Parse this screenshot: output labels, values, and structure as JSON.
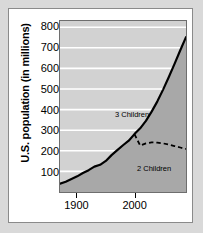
{
  "chart_data": {
    "type": "line",
    "title": "",
    "xlabel": "",
    "ylabel": "U.S. population (in millions)",
    "xlim": [
      1870,
      2090
    ],
    "ylim": [
      0,
      830
    ],
    "yticks": [
      100,
      200,
      300,
      400,
      500,
      600,
      700,
      800
    ],
    "ytick_labels": [
      "100",
      "200",
      "300",
      "400",
      "500",
      "600",
      "700",
      "800"
    ],
    "xticks": [
      1900,
      2000
    ],
    "xtick_labels": [
      "1900",
      "2000"
    ],
    "grid": "horizontal-white-gridlines",
    "legend_position": "inline-annotations",
    "series": [
      {
        "name": "3 Children",
        "style": "solid",
        "color": "#000000",
        "fill": "#a8a8a8",
        "annotation": "3 Children",
        "x": [
          1870,
          1880,
          1890,
          1900,
          1910,
          1920,
          1930,
          1940,
          1950,
          1960,
          1970,
          1980,
          1990,
          2000,
          2010,
          2020,
          2030,
          2040,
          2050,
          2060,
          2070,
          2080,
          2090
        ],
        "y": [
          40,
          50,
          63,
          76,
          92,
          106,
          123,
          132,
          151,
          179,
          203,
          227,
          249,
          281,
          309,
          345,
          390,
          440,
          497,
          558,
          622,
          688,
          752
        ]
      },
      {
        "name": "2 Children",
        "style": "dashed",
        "color": "#000000",
        "annotation": "2 Children",
        "x": [
          2000,
          2010,
          2020,
          2030,
          2040,
          2050,
          2060,
          2070,
          2080,
          2090
        ],
        "y": [
          281,
          225,
          236,
          241,
          240,
          236,
          230,
          223,
          216,
          209
        ]
      }
    ]
  },
  "colors": {
    "page_background": "#d9d9d9",
    "figure_background": "#ffffff",
    "plot_background": "#d2d2d2",
    "area_fill": "#a8a8a8",
    "gridline": "#ffffff",
    "axis_border": "#6e6e6e",
    "text": "#000000"
  }
}
